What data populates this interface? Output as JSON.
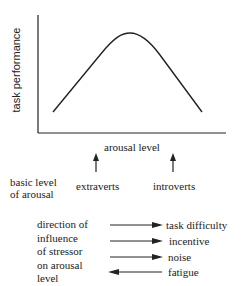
{
  "diagram": {
    "y_axis_label": "task performance",
    "x_axis_label": "arousal level",
    "curve": "inverted-U (Yerkes-Dodson)",
    "basic_level_label": "basic level\nof arousal",
    "markers": [
      {
        "label": "extraverts",
        "direction": "up"
      },
      {
        "label": "introverts",
        "direction": "up"
      }
    ],
    "stressor_label": "direction of\ninfluence\nof stressor\non arousal\nlevel",
    "stressors": [
      {
        "label": "task difficulty",
        "direction": "right"
      },
      {
        "label": "incentive",
        "direction": "right"
      },
      {
        "label": "noise",
        "direction": "right"
      },
      {
        "label": "fatigue",
        "direction": "left"
      }
    ],
    "line_color": "#222222"
  }
}
